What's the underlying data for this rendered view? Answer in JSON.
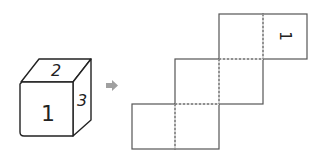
{
  "cube": {
    "front_label": "1",
    "top_label": "2",
    "right_label": "3"
  },
  "arrow": {
    "glyph": "➡",
    "color": "#9a9a9a"
  },
  "net": {
    "marked_face_label": "1",
    "line_color": "#555555",
    "fold_style": "dashed"
  }
}
